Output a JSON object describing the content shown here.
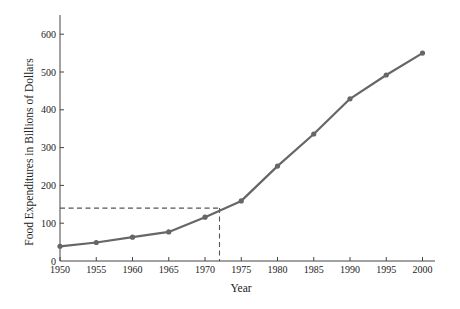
{
  "chart_data": {
    "type": "line",
    "title": "",
    "xlabel": "Year",
    "ylabel": "Food Expenditures in Billions of Dollars",
    "x": [
      1950,
      1955,
      1960,
      1965,
      1970,
      1975,
      1980,
      1985,
      1990,
      1995,
      2000
    ],
    "series": [
      {
        "name": "Food Expenditures",
        "values": [
          39,
          49,
          63,
          77,
          116,
          159,
          251,
          336,
          429,
          492,
          550
        ]
      }
    ],
    "xlim": [
      1950,
      2004
    ],
    "ylim": [
      0,
      650
    ],
    "xticks": [
      1950,
      1955,
      1960,
      1965,
      1970,
      1975,
      1980,
      1985,
      1990,
      1995,
      2000
    ],
    "yticks": [
      0,
      100,
      200,
      300,
      400,
      500,
      600
    ],
    "grid": false,
    "legend": null,
    "annotations": [
      {
        "type": "dashed-reference-lines",
        "x": 1972,
        "y": 140,
        "description": "Dashed lines from x=1972 up to curve and across to y≈140"
      }
    ],
    "colors": {
      "line": "#666666",
      "marker": "#666666",
      "axis": "#444444",
      "reference": "#555555"
    }
  }
}
